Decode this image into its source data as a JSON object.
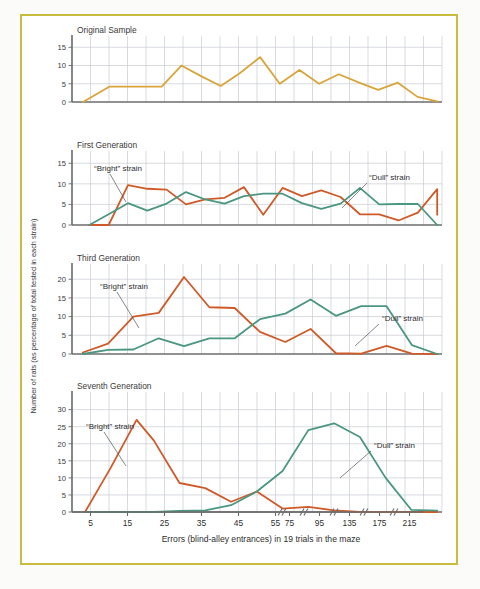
{
  "figure": {
    "border_color": "#c9bb3e",
    "background": "#ffffff",
    "axis_title_x": "Errors (blind-alley entrances) in 19 trials in the maze",
    "axis_title_y": "Number of rats (as percentage of total tested in each strain)",
    "bright_label": "“Bright” strain",
    "dull_label": "“Dull” strain",
    "bright_color": "#cf5a28",
    "dull_color": "#4a9681",
    "original_color": "#d9a53a",
    "grid_color": "#c9ccd2",
    "axis_color": "#6c6c6c"
  },
  "chart_data": {
    "type": "line",
    "xlabel": "Errors (blind-alley entrances) in 19 trials in the maze",
    "ylabel": "Number of rats (as percentage of total tested in each strain)",
    "grid": true,
    "legend": "inline-annotations",
    "x_tick_labels": [
      "5",
      "15",
      "25",
      "35",
      "45",
      "55",
      "75",
      "95",
      "135",
      "175",
      "215"
    ],
    "x_axis_breaks": [
      55,
      75,
      95,
      135,
      175
    ],
    "x_note": "axis is compressed with break marks after 55; positions 75, 95, 135, 175, 215 are each one compressed step",
    "x_values": [
      0,
      5,
      10,
      15,
      20,
      25,
      30,
      35,
      40,
      45,
      50,
      55,
      60,
      65,
      70,
      75,
      80,
      85,
      90,
      95,
      100
    ],
    "panels": [
      {
        "label": "Original Sample",
        "ylim": [
          0,
          17
        ],
        "yticks": [
          0,
          5,
          10,
          15
        ],
        "series": [
          {
            "name": "Original Sample",
            "color": "#d9a53a",
            "x": [
              2,
              10,
              14,
              20,
              26,
              32,
              38,
              44,
              50,
              56,
              62,
              68,
              74,
              80,
              86,
              92,
              98,
              104,
              110
            ],
            "values": [
              0,
              4.2,
              4.2,
              4.2,
              4.2,
              10.0,
              7.1,
              4.4,
              8.0,
              12.3,
              5.0,
              8.8,
              5.0,
              7.6,
              5.4,
              3.3,
              5.3,
              1.4,
              0.2
            ]
          }
        ]
      },
      {
        "label": "First Generation",
        "ylim": [
          0,
          17
        ],
        "yticks": [
          0,
          5,
          10,
          15
        ],
        "series": [
          {
            "name": "“Bright” strain",
            "color": "#cf5a28",
            "x": [
              4,
              10,
              16,
              22,
              28,
              34,
              40,
              46,
              52,
              58,
              64,
              70,
              76,
              82,
              88,
              94,
              100,
              106,
              112
            ],
            "values": [
              0,
              0.0,
              9.7,
              8.8,
              8.6,
              5.0,
              6.2,
              6.6,
              9.2,
              2.5,
              9.0,
              7.0,
              8.4,
              6.8,
              2.6,
              2.6,
              1.1,
              3.0,
              8.7
            ],
            "end_drop": 2.5
          },
          {
            "name": "“Dull” strain",
            "color": "#4a9681",
            "x": [
              4,
              10,
              16,
              22,
              28,
              34,
              40,
              46,
              52,
              58,
              64,
              70,
              76,
              82,
              88,
              94,
              100,
              106,
              112
            ],
            "values": [
              0,
              2.6,
              5.3,
              3.5,
              5.2,
              8.0,
              6.2,
              5.2,
              7.0,
              7.6,
              7.6,
              5.3,
              3.9,
              5.2,
              9.0,
              5.0,
              5.1,
              5.1,
              0.0
            ]
          }
        ]
      },
      {
        "label": "Third Generation",
        "ylim": [
          0,
          23
        ],
        "yticks": [
          0,
          5,
          10,
          15,
          20
        ],
        "series": [
          {
            "name": "“Bright” strain",
            "color": "#cf5a28",
            "x": [
              2,
              10,
              18,
              26,
              34,
              42,
              50,
              58,
              66,
              74,
              82,
              90,
              98,
              106,
              114
            ],
            "values": [
              0.4,
              2.8,
              10.0,
              11.0,
              20.6,
              12.5,
              12.3,
              5.9,
              3.2,
              6.7,
              0.2,
              0.1,
              2.2,
              0.1,
              0.0
            ]
          },
          {
            "name": "“Dull” strain",
            "color": "#4a9681",
            "x": [
              2,
              10,
              18,
              26,
              34,
              42,
              50,
              58,
              66,
              74,
              82,
              90,
              98,
              106,
              114
            ],
            "values": [
              0.0,
              1.1,
              1.2,
              4.2,
              2.1,
              4.2,
              4.2,
              9.3,
              10.8,
              14.6,
              10.2,
              12.8,
              12.8,
              2.4,
              0.0
            ]
          }
        ]
      },
      {
        "label": "Seventh Generation",
        "ylim": [
          0,
          34
        ],
        "yticks": [
          0,
          5,
          10,
          15,
          20,
          25,
          30
        ],
        "series": [
          {
            "name": "“Bright” strain",
            "color": "#cf5a28",
            "x": [
              4,
              16,
              28,
              36,
              48,
              60,
              72,
              84,
              96,
              108,
              120,
              132,
              144,
              156,
              168
            ],
            "values": [
              0,
              13.0,
              27.0,
              21.0,
              8.5,
              7.0,
              3.0,
              6.0,
              1.0,
              1.5,
              0.5,
              0.0,
              0,
              0,
              0
            ]
          },
          {
            "name": "“Dull” strain",
            "color": "#4a9681",
            "x": [
              4,
              16,
              28,
              36,
              48,
              60,
              72,
              84,
              96,
              108,
              120,
              132,
              144,
              156,
              168
            ],
            "values": [
              0,
              0,
              0,
              0,
              0.3,
              0.5,
              2.0,
              6.0,
              12.0,
              24.0,
              26.0,
              22.0,
              10.0,
              0.6,
              0.4
            ]
          }
        ]
      }
    ]
  }
}
